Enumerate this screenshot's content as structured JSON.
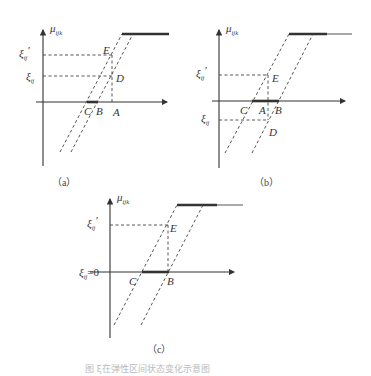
{
  "figure": {
    "panels": [
      {
        "id": "a",
        "caption": "（a）",
        "y_axis_label": "μ",
        "y_axis_sub": "ijk",
        "tick_labels": [
          {
            "symbol": "ξ",
            "sub": "ij",
            "prime": "′",
            "text": "ξij′"
          },
          {
            "symbol": "ξ",
            "sub": "ij",
            "prime": "",
            "text": "ξij"
          }
        ],
        "points": [
          "E",
          "D",
          "C",
          "B",
          "A"
        ]
      },
      {
        "id": "b",
        "caption": "（b）",
        "y_axis_label": "μ",
        "y_axis_sub": "ijk",
        "tick_labels": [
          {
            "symbol": "ξ",
            "sub": "ij",
            "prime": "′",
            "text": "ξij′"
          },
          {
            "symbol": "ξ",
            "sub": "ij",
            "prime": "",
            "text": "ξij"
          }
        ],
        "points": [
          "E",
          "C",
          "A",
          "B",
          "D"
        ]
      },
      {
        "id": "c",
        "caption": "（c）",
        "y_axis_label": "μ",
        "y_axis_sub": "ijk",
        "tick_labels": [
          {
            "symbol": "ξ",
            "sub": "ij",
            "prime": "′",
            "text": "ξij′"
          },
          {
            "symbol": "ξ",
            "sub": "ij",
            "prime": "",
            "suffix": "=0",
            "text": "ξij=0"
          }
        ],
        "points": [
          "E",
          "C",
          "B"
        ]
      }
    ],
    "bottom_caption": "图  ξ在弹性区间状态变化示意图"
  }
}
